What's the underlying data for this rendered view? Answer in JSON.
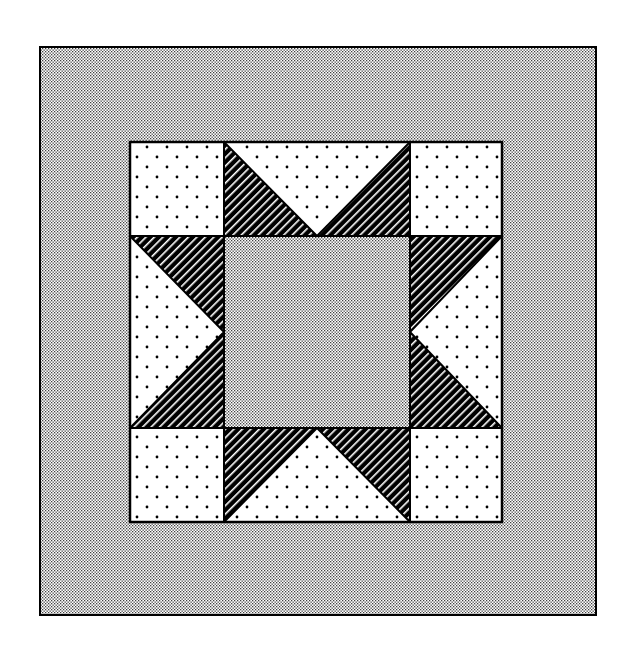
{
  "figure": {
    "title": "",
    "kind": "quilt block diagram",
    "pattern_name": "",
    "canvas": {
      "width": 635,
      "height": 650
    }
  },
  "colors": {
    "background": "#ffffff",
    "ink": "#000000",
    "border_fabric_fg": "#000000",
    "border_fabric_bg": "#ffffff",
    "dot_fabric_fg": "#000000",
    "dot_fabric_bg": "#ffffff",
    "stripe_fabric_fg": "#000000",
    "stripe_fabric_bg": "#ffffff",
    "center_fabric_fg": "#000000",
    "center_fabric_bg": "#ffffff"
  },
  "outer_border": {
    "x": 40,
    "y": 47,
    "w": 556,
    "h": 568,
    "fabric": "fine-stipple"
  },
  "block": {
    "x": 130,
    "y": 142,
    "w": 372,
    "h": 380,
    "col_edges": [
      130,
      224,
      410,
      502
    ],
    "row_edges": [
      142,
      236,
      428,
      522
    ],
    "corners": [
      {
        "name": "top-left",
        "fabric": "dot"
      },
      {
        "name": "top-right",
        "fabric": "dot"
      },
      {
        "name": "bottom-left",
        "fabric": "dot"
      },
      {
        "name": "bottom-right",
        "fabric": "dot"
      }
    ],
    "center": {
      "fabric": "fine-stipple"
    },
    "star_points": [
      {
        "side": "top",
        "base": "dot",
        "points": "stripe"
      },
      {
        "side": "bottom",
        "base": "dot",
        "points": "stripe"
      },
      {
        "side": "left",
        "base": "dot",
        "points": "stripe"
      },
      {
        "side": "right",
        "base": "dot",
        "points": "stripe"
      }
    ]
  },
  "fabrics": [
    "fine-stipple",
    "dot",
    "stripe"
  ]
}
